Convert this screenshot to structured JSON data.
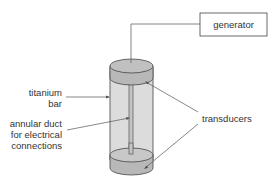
{
  "labels": {
    "generator": "generator",
    "titanium_line1": "titanium",
    "titanium_line2": "bar",
    "duct_line1": "annular duct",
    "duct_line2": "for electrical",
    "duct_line3": "connections",
    "transducers": "transducers"
  },
  "colors": {
    "stroke": "#444444",
    "bar_fill": "#dcdcdc",
    "transducer_fill": "#b8b8b8",
    "transducer_top": "#c8c8c8"
  }
}
